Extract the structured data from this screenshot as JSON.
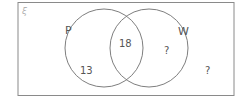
{
  "diagram": {
    "type": "venn",
    "universal_symbol": "ξ",
    "sets": [
      {
        "name": "P",
        "only_value": "13"
      },
      {
        "name": "W",
        "only_value": "?"
      }
    ],
    "intersection_value": "18",
    "outside_value": "?"
  },
  "colors": {
    "line": "#6f6f6f",
    "border": "#8a8a8a",
    "text": "#555555"
  }
}
